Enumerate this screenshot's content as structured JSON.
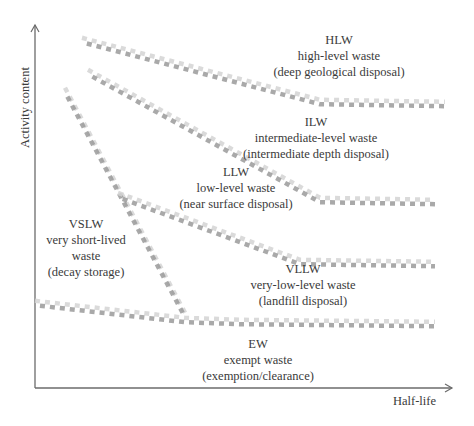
{
  "diagram": {
    "axes": {
      "x_label": "Half-life",
      "y_label": "Activity content"
    },
    "regions": [
      {
        "id": "hlw",
        "abbr": "HLW",
        "name": "high-level waste",
        "disposal": "(deep geological disposal)"
      },
      {
        "id": "ilw",
        "abbr": "ILW",
        "name": "intermediate-level waste",
        "disposal": "(intermediate depth disposal)"
      },
      {
        "id": "llw",
        "abbr": "LLW",
        "name": "low-level waste",
        "disposal": "(near surface disposal)"
      },
      {
        "id": "vslw",
        "abbr": "VSLW",
        "name_line1": "very short-lived",
        "name_line2": "waste",
        "disposal": "(decay storage)"
      },
      {
        "id": "vllw",
        "abbr": "VLLW",
        "name": "very-low-level waste",
        "disposal": "(landfill disposal)"
      },
      {
        "id": "ew",
        "abbr": "EW",
        "name": "exempt waste",
        "disposal": "(exemption/clearance)"
      }
    ],
    "boundaries": [
      {
        "id": "hlw-ilw",
        "points": [
          [
            82,
            40
          ],
          [
            320,
            102
          ],
          [
            445,
            104
          ]
        ]
      },
      {
        "id": "ilw-llw",
        "points": [
          [
            88,
            72
          ],
          [
            320,
            200
          ],
          [
            435,
            202
          ]
        ]
      },
      {
        "id": "vslw",
        "points": [
          [
            65,
            90
          ],
          [
            185,
            315
          ]
        ]
      },
      {
        "id": "llw-vllw",
        "points": [
          [
            118,
            195
          ],
          [
            300,
            262
          ],
          [
            435,
            264
          ]
        ]
      },
      {
        "id": "vllw-ew",
        "points": [
          [
            35,
            303
          ],
          [
            185,
            320
          ],
          [
            240,
            322
          ],
          [
            435,
            324
          ]
        ]
      }
    ],
    "colors": {
      "axis": "#6b6b6b",
      "boundary_light": "#d4d4d4",
      "boundary_dark": "#9a9a9a",
      "text": "#3a3a3a"
    }
  }
}
